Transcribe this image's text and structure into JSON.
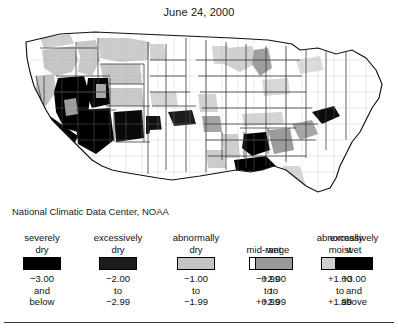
{
  "title": "June 24, 2000",
  "credit": "National Climatic Data Center, NOAA",
  "legend": {
    "classes": [
      {
        "label_line1": "severely",
        "label_line2": "dry",
        "color": "#000000",
        "n1": "−3.00",
        "n2": "and",
        "n3": "below"
      },
      {
        "label_line1": "excessively",
        "label_line2": "dry",
        "color": "#1c1c1c",
        "n1": "−2.00",
        "n2": "to",
        "n3": "−2.99"
      },
      {
        "label_line1": "abnormally",
        "label_line2": "dry",
        "color": "#c4c4c4",
        "n1": "−1.00",
        "n2": "to",
        "n3": "−1.99"
      },
      {
        "label_line1": "mid-range",
        "label_line2": "",
        "color": "#ffffff",
        "n1": "−0.99",
        "n2": "to",
        "n3": "+0.99"
      },
      {
        "label_line1": "abnormally",
        "label_line2": "moist",
        "color": "#cfcfcf",
        "n1": "+1.00",
        "n2": "to",
        "n3": "+1.99"
      },
      {
        "label_line1": "wet",
        "label_line2": "",
        "color": "#9a9a9a",
        "n1": "+2.00",
        "n2": "to",
        "n3": "+2.99"
      },
      {
        "label_line1": "excessively",
        "label_line2": "wet",
        "color": "#000000",
        "n1": "+3.00",
        "n2": "and",
        "n3": "above"
      }
    ]
  },
  "map": {
    "name": "united-states-palmer-drought-index-map",
    "outline_color": "#111111",
    "state_border_color": "#444444",
    "county_line_color": "#b0b0b0",
    "background": "#ffffff",
    "regions": [
      {
        "name": "nevada-severely-dry",
        "class": "severely dry",
        "color": "#000000"
      },
      {
        "name": "southern-california-severely-dry",
        "class": "severely dry",
        "color": "#000000"
      },
      {
        "name": "arizona-severely-dry",
        "class": "severely dry",
        "color": "#000000"
      },
      {
        "name": "utah-severely-dry",
        "class": "severely dry",
        "color": "#000000"
      },
      {
        "name": "southern-new-mexico-severely-dry",
        "class": "severely dry",
        "color": "#000000"
      },
      {
        "name": "west-texas-severely-dry",
        "class": "severely dry",
        "color": "#111111"
      },
      {
        "name": "oregon-abnormally-dry",
        "class": "abnormally dry",
        "color": "#c4c4c4"
      },
      {
        "name": "idaho-abnormally-dry",
        "class": "abnormally dry",
        "color": "#c8c8c8"
      },
      {
        "name": "northern-california-abnormally-dry",
        "class": "abnormally dry",
        "color": "#c4c4c4"
      },
      {
        "name": "montana-abnormally-dry",
        "class": "abnormally dry",
        "color": "#cccccc"
      },
      {
        "name": "wyoming-abnormally-dry",
        "class": "abnormally dry",
        "color": "#c6c6c6"
      },
      {
        "name": "colorado-abnormally-dry",
        "class": "abnormally dry",
        "color": "#c4c4c4"
      },
      {
        "name": "great-plains-mid-range",
        "class": "mid-range",
        "color": "#ffffff"
      },
      {
        "name": "texas-mid-range",
        "class": "mid-range",
        "color": "#ffffff"
      },
      {
        "name": "northeast-mid-range",
        "class": "mid-range",
        "color": "#ffffff"
      },
      {
        "name": "oklahoma-excessively-dry",
        "class": "excessively dry",
        "color": "#1c1c1c"
      },
      {
        "name": "kansas-abnormally-dry",
        "class": "abnormally dry",
        "color": "#c8c8c8"
      },
      {
        "name": "great-lakes-abnormally-moist",
        "class": "abnormally moist",
        "color": "#cfcfcf"
      },
      {
        "name": "michigan-wet",
        "class": "wet",
        "color": "#9a9a9a"
      },
      {
        "name": "ohio-valley-abnormally-moist",
        "class": "abnormally moist",
        "color": "#d2d2d2"
      },
      {
        "name": "alabama-excessively-wet",
        "class": "excessively wet",
        "color": "#000000"
      },
      {
        "name": "georgia-wet",
        "class": "wet",
        "color": "#9a9a9a"
      },
      {
        "name": "florida-panhandle-excessively-wet",
        "class": "excessively wet",
        "color": "#000000"
      },
      {
        "name": "south-carolina-wet",
        "class": "wet",
        "color": "#a0a0a0"
      },
      {
        "name": "mississippi-abnormally-moist",
        "class": "abnormally moist",
        "color": "#cfcfcf"
      },
      {
        "name": "louisiana-abnormally-moist",
        "class": "abnormally moist",
        "color": "#cccccc"
      },
      {
        "name": "florida-peninsula-abnormally-moist",
        "class": "abnormally moist",
        "color": "#d4d4d4"
      },
      {
        "name": "arkansas-wet",
        "class": "wet",
        "color": "#9e9e9e"
      },
      {
        "name": "missouri-abnormally-moist",
        "class": "abnormally moist",
        "color": "#d0d0d0"
      },
      {
        "name": "washington-excessively-wet-coast",
        "class": "excessively wet",
        "color": "#111111"
      },
      {
        "name": "north-carolina-coast-excessively-wet",
        "class": "excessively wet",
        "color": "#0d0d0d"
      }
    ]
  }
}
